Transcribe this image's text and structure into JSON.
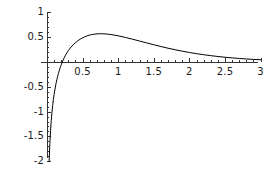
{
  "chart_data": {
    "type": "line",
    "title": "",
    "subtitle": "",
    "xlabel": "",
    "ylabel": "",
    "xlim": [
      0,
      3.05
    ],
    "ylim": [
      -2.0,
      1.0
    ],
    "grid": false,
    "legend": null,
    "axis_style": "mathematica-crossed-axes",
    "x_axis_position_value": 0,
    "y_axis_position_value": 0,
    "xticks": [
      0.5,
      1,
      1.5,
      2,
      2.5,
      3
    ],
    "xtick_labels": [
      "0.5",
      "1",
      "1.5",
      "2",
      "2.5",
      "3"
    ],
    "yticks": [
      1,
      0.5,
      -0.5,
      -1,
      -1.5,
      -2
    ],
    "ytick_labels": [
      "1",
      "0.5",
      "-0.5",
      "-1",
      "-1.5",
      "-2"
    ],
    "minor_tick_count_between": 4,
    "series": [
      {
        "name": "curve",
        "color": "#000000",
        "width": 1,
        "x": [
          0.03,
          0.04,
          0.05,
          0.06,
          0.07,
          0.08,
          0.09,
          0.1,
          0.11,
          0.12,
          0.13,
          0.14,
          0.15,
          0.16,
          0.17,
          0.18,
          0.19,
          0.2,
          0.22,
          0.24,
          0.26,
          0.28,
          0.3,
          0.325,
          0.35,
          0.375,
          0.4,
          0.425,
          0.45,
          0.475,
          0.5,
          0.525,
          0.55,
          0.575,
          0.6,
          0.625,
          0.65,
          0.7,
          0.75,
          0.8,
          0.85,
          0.9,
          0.95,
          1.0,
          1.1,
          1.2,
          1.3,
          1.4,
          1.5,
          1.6,
          1.7,
          1.8,
          1.9,
          2.0,
          2.1,
          2.2,
          2.3,
          2.4,
          2.5,
          2.6,
          2.7,
          2.8,
          2.9,
          3.0
        ],
        "y": [
          -2.0,
          -1.64,
          -1.38,
          -1.175,
          -1.01,
          -0.873,
          -0.755,
          -0.653,
          -0.563,
          -0.483,
          -0.412,
          -0.347,
          -0.287,
          -0.233,
          -0.183,
          -0.137,
          -0.094,
          -0.054,
          0.018,
          0.081,
          0.137,
          0.186,
          0.23,
          0.278,
          0.32,
          0.357,
          0.39,
          0.419,
          0.445,
          0.468,
          0.488,
          0.505,
          0.52,
          0.533,
          0.543,
          0.552,
          0.558,
          0.567,
          0.57,
          0.568,
          0.562,
          0.553,
          0.541,
          0.528,
          0.496,
          0.46,
          0.423,
          0.385,
          0.348,
          0.312,
          0.278,
          0.247,
          0.218,
          0.192,
          0.168,
          0.147,
          0.128,
          0.111,
          0.096,
          0.083,
          0.071,
          0.061,
          0.052,
          0.045
        ]
      }
    ]
  },
  "geometry": {
    "x0_px": 47,
    "y0_px": 62,
    "px_per_x_unit": 71.2,
    "px_per_y_unit": 49.6,
    "x_axis_left_px": 41,
    "x_axis_right_px": 258,
    "y_axis_top_px": 12,
    "y_axis_bottom_px": 158
  }
}
